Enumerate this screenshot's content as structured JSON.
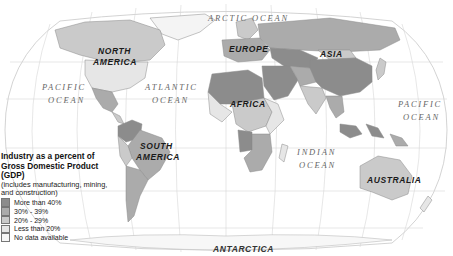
{
  "map": {
    "title": "Industry as a percent of Gross Domestic Product (GDP)",
    "subtitle": "(includes manufacturing, mining, and construction)",
    "colors": {
      "ocean": "#ffffff",
      "graticule": "#cfcfcf",
      "border": "#8a8a8a",
      "more_than_40": "#8c8c8c",
      "30_39": "#ababab",
      "20_29": "#cacaca",
      "less_than_20": "#e6e6e6",
      "no_data": "#f4f4f4"
    }
  },
  "labels": {
    "oceans": {
      "arctic": "ARCTIC OCEAN",
      "pacific_west_1": "PACIFIC",
      "pacific_west_2": "OCEAN",
      "atlantic_1": "ATLANTIC",
      "atlantic_2": "OCEAN",
      "indian_1": "INDIAN",
      "indian_2": "OCEAN",
      "pacific_east_1": "PACIFIC",
      "pacific_east_2": "OCEAN"
    },
    "continents": {
      "north_america_1": "NORTH",
      "north_america_2": "AMERICA",
      "south_america_1": "SOUTH",
      "south_america_2": "AMERICA",
      "europe": "EUROPE",
      "asia": "ASIA",
      "africa": "AFRICA",
      "australia": "AUSTRALIA",
      "antarctica": "ANTARCTICA"
    }
  },
  "legend": {
    "title_line1": "Industry as a percent of",
    "title_line2": "Gross Domestic Product (GDP)",
    "subtitle_line1": "(includes manufacturing, mining,",
    "subtitle_line2": "and construction)",
    "items": [
      {
        "label": "More than 40%",
        "color": "#8c8c8c"
      },
      {
        "label": "30% - 39%",
        "color": "#ababab"
      },
      {
        "label": "20% - 29%",
        "color": "#cacaca"
      },
      {
        "label": "Less than 20%",
        "color": "#e6e6e6"
      },
      {
        "label": "No data available",
        "color": "#f7f7f7"
      }
    ]
  }
}
